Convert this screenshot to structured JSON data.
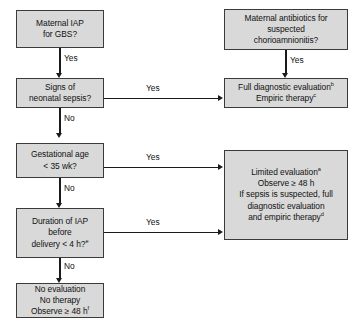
{
  "diagram": {
    "nodes": [
      {
        "id": "maternal-iap-gbs",
        "lines": [
          "Maternal IAP",
          "for GBS?"
        ]
      },
      {
        "id": "maternal-antibiotics-chorioamnionitis",
        "lines": [
          "Maternal antibiotics for",
          "suspected",
          "chorioamnionitis?"
        ]
      },
      {
        "id": "signs-neonatal-sepsis",
        "lines": [
          "Signs of",
          "neonatal sepsis?"
        ]
      },
      {
        "id": "full-diagnostic-evaluation",
        "lines": [
          "Full diagnostic evaluation",
          "Empiric therapy"
        ],
        "superscripts": [
          "b",
          "c"
        ]
      },
      {
        "id": "gestational-age",
        "lines": [
          "Gestational age",
          "< 35 wk?"
        ]
      },
      {
        "id": "limited-evaluation",
        "lines": [
          "Limited evaluation",
          "Observe ≥ 48 h",
          "If sepsis is suspected, full",
          "diagnostic evaluation",
          "and empiric therapy"
        ],
        "superscripts": [
          "a",
          "",
          "",
          "",
          "d"
        ]
      },
      {
        "id": "duration-of-iap",
        "lines": [
          "Duration of IAP",
          "before",
          "delivery < 4 h?"
        ],
        "superscripts": [
          "",
          "",
          "e"
        ]
      },
      {
        "id": "no-evaluation",
        "lines": [
          "No evaluation",
          "No therapy",
          "Observe ≥ 48 h"
        ],
        "superscripts": [
          "",
          "",
          "f"
        ]
      }
    ],
    "edge_labels": {
      "iap_to_sepsis": "Yes",
      "chorio_to_full": "Yes",
      "sepsis_to_full": "Yes",
      "sepsis_to_gestational": "No",
      "gestational_to_limited": "Yes",
      "gestational_to_duration": "No",
      "duration_to_limited": "Yes",
      "duration_to_noeval": "No"
    },
    "colors": {
      "box_fill": "#d9d9d9",
      "box_border": "#3b3b3b",
      "connector": "#1b1b1b",
      "text": "#111111",
      "background": "#ffffff"
    }
  }
}
